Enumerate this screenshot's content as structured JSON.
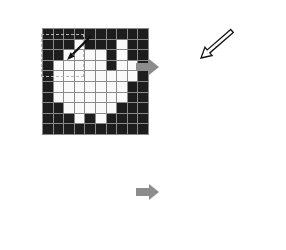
{
  "colors": {
    "background": "#ffffff",
    "cell_off": "#1d1d1d",
    "cell_on": "#fafafa",
    "grid_line": "#8a8a8a",
    "big_arrow": "#8c8c8c",
    "dashed_box": "#b8b8b8",
    "pointer_arrow_dark": "#111111",
    "pointer_arrow_light": "#ffffff"
  },
  "panels": {
    "top_left": {
      "rows": 10,
      "cols": 10,
      "matrix": [
        "0000000000",
        "0001000100",
        "0011110100",
        "0111110110",
        "0111111110",
        "0111111100",
        "0111111100",
        "0011111000",
        "0001010000",
        "0000000000"
      ],
      "overlays": {
        "dashed_box": {
          "row_start": 3,
          "col_start": 3,
          "row_end": 6,
          "col_end": 6
        },
        "pointer_arrow": {
          "style": "solid-dark",
          "direction": "down-left",
          "tip_cell": {
            "row": 5,
            "col": 5
          }
        }
      }
    },
    "top_right": {
      "rows": 10,
      "cols": 10,
      "matrix": [
        "0000000000",
        "0000000000",
        "0000000000",
        "0001010000",
        "0001111100",
        "0000110000",
        "0000000000",
        "0000000000",
        "0000000000",
        "0000000000"
      ],
      "overlays": {
        "pointer_arrow": {
          "style": "outlined-light",
          "direction": "down-left",
          "tip_cell": {
            "row": 4,
            "col": 4
          }
        }
      }
    },
    "bottom_left": {
      "rows": 10,
      "cols": 10,
      "matrix": [
        "0000000000",
        "0000000000",
        "0000000000",
        "0000000000",
        "0000110000",
        "0000010000",
        "0000000000",
        "0000000000",
        "0000000000",
        "0000000000"
      ],
      "overlays": {}
    },
    "bottom_right": {
      "rows": 10,
      "cols": 10,
      "matrix": [
        "0000000000",
        "0000000000",
        "0000000000",
        "0000000000",
        "0000000000",
        "0000000000",
        "0000000000",
        "0000000000",
        "0000000000",
        "0000000000"
      ],
      "overlays": {}
    }
  },
  "transform_arrows": {
    "top": {
      "direction": "right"
    },
    "bottom": {
      "direction": "right"
    }
  }
}
